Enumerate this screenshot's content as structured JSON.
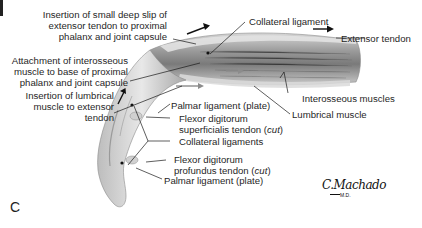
{
  "figure": {
    "panel_letter": "C",
    "signature": "C.Machado",
    "signature_suffix": "M.D.",
    "colors": {
      "background": "#ffffff",
      "tissue_light": "#e6e6e6",
      "tissue_mid": "#b9b9b9",
      "tissue_dark": "#6f6f6f",
      "leader_line": "#1a1a1a",
      "arrow_gray": "#8c8c8c"
    }
  },
  "labels": {
    "insertion_deep_slip": [
      "Insertion of small deep slip of",
      "extensor tendon to proximal",
      "phalanx and joint capsule"
    ],
    "attachment_interosseous": [
      "Attachment of interosseous",
      "muscle to base of proximal",
      "phalanx and joint capsule"
    ],
    "insertion_lumbrical": [
      "Insertion of lumbrical",
      "muscle to extensor",
      "tendon"
    ],
    "collateral_ligament": "Collateral ligament",
    "extensor_tendon": "Extensor tendon",
    "interosseous_muscles": "Interosseous muscles",
    "lumbrical_muscle": "Lumbrical muscle",
    "palmar_ligament_upper": "Palmar ligament (plate)",
    "fds_tendon": [
      "Flexor digitorum",
      "superficialis tendon",
      "cut"
    ],
    "collateral_ligaments": "Collateral ligaments",
    "fdp_tendon": [
      "Flexor digitorum",
      "profundus tendon",
      "cut"
    ],
    "palmar_ligament_lower": "Palmar ligament (plate)"
  }
}
